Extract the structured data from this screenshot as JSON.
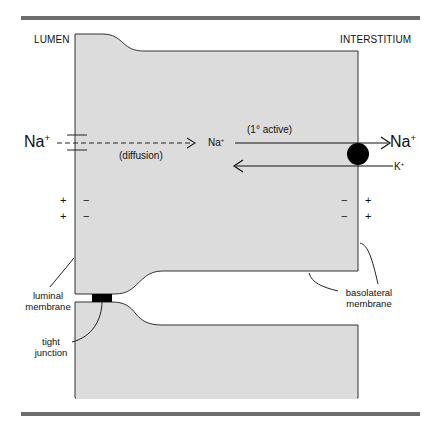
{
  "labels": {
    "lumen": "LUMEN",
    "interstitium": "INTERSTITIUM",
    "na_left": "Na",
    "na_left_charge": "+",
    "na_mid": "Na",
    "na_mid_charge": "+",
    "na_right": "Na",
    "na_right_charge": "+",
    "k": "K",
    "k_charge": "+",
    "diffusion": "(diffusion)",
    "active": "(1° active)",
    "luminal_membrane_1": "luminal",
    "luminal_membrane_2": "membrane",
    "tight_junction_1": "tight",
    "tight_junction_2": "junction",
    "basolateral_membrane_1": "basolateral",
    "basolateral_membrane_2": "membrane"
  },
  "charges": {
    "luminal_outside": [
      "+",
      "+"
    ],
    "luminal_inside": [
      "−",
      "−"
    ],
    "basolateral_inside": [
      "−",
      "−"
    ],
    "basolateral_outside": [
      "+",
      "+"
    ]
  },
  "colors": {
    "cell_fill": "#dcdcdc",
    "outline": "#333333",
    "rule": "#6e6e6e",
    "pump": "#000000"
  }
}
